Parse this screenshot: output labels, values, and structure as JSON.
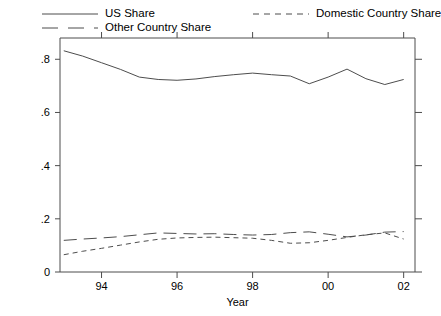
{
  "legend": {
    "entries": [
      {
        "label": "US Share",
        "key": "solid-line-key",
        "dash": "none"
      },
      {
        "label": "Other Country Share",
        "key": "long-dash-line-key",
        "dash": "long"
      },
      {
        "label": "Domestic Country Share",
        "key": "short-dash-line-key",
        "dash": "short"
      }
    ]
  },
  "chart_data": {
    "type": "line",
    "title": "",
    "xlabel": "Year",
    "ylabel": "",
    "xlim": [
      1992.9,
      2002.3
    ],
    "ylim": [
      0,
      0.88
    ],
    "grid": false,
    "legend_position": "top",
    "xticks": [
      1994,
      1996,
      1998,
      2000,
      2002
    ],
    "xticklabels": [
      "94",
      "96",
      "98",
      "00",
      "02"
    ],
    "yticks": [
      0,
      0.2,
      0.4,
      0.6,
      0.8
    ],
    "yticklabels": [
      "0",
      ".2",
      ".4",
      ".6",
      ".8"
    ],
    "x": [
      1993,
      1993.5,
      1994,
      1994.5,
      1995,
      1995.5,
      1996,
      1996.5,
      1997,
      1997.5,
      1998,
      1998.5,
      1999,
      1999.5,
      2000,
      2000.5,
      2001,
      2001.5,
      2002
    ],
    "series": [
      {
        "name": "US Share",
        "style": "solid",
        "values": [
          0.832,
          0.812,
          0.787,
          0.762,
          0.733,
          0.724,
          0.721,
          0.726,
          0.735,
          0.742,
          0.748,
          0.742,
          0.737,
          0.708,
          0.733,
          0.763,
          0.727,
          0.705,
          0.724
        ]
      },
      {
        "name": "Other Country Share",
        "style": "long-dash",
        "values": [
          0.119,
          0.124,
          0.128,
          0.133,
          0.14,
          0.147,
          0.145,
          0.143,
          0.144,
          0.141,
          0.139,
          0.141,
          0.148,
          0.151,
          0.142,
          0.132,
          0.139,
          0.15,
          0.152
        ]
      },
      {
        "name": "Domestic Country Share",
        "style": "short-dash",
        "values": [
          0.065,
          0.078,
          0.089,
          0.101,
          0.113,
          0.123,
          0.128,
          0.13,
          0.131,
          0.129,
          0.127,
          0.119,
          0.108,
          0.11,
          0.119,
          0.13,
          0.14,
          0.147,
          0.124
        ]
      }
    ]
  }
}
